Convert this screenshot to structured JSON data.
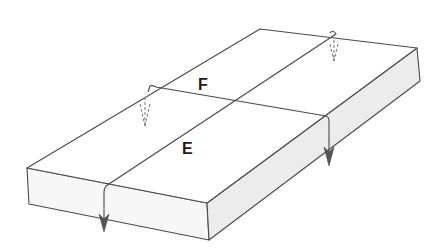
{
  "diagram": {
    "type": "block-diagram",
    "colors": {
      "line": "#4a4a4a",
      "top_face": "#ffffff",
      "front_face": "#f7f7f7",
      "side_face": "#ececec",
      "label": "#1a1a1a"
    },
    "labels": {
      "fault_e": "E",
      "fault_f": "F"
    },
    "faults": [
      {
        "id": "E",
        "trace": "diagonal fault running from back-right to front-left",
        "arrow_dashed_at": "back",
        "arrow_solid_at": "front face"
      },
      {
        "id": "F",
        "trace": "fault running from left-back to right side",
        "arrow_dashed_at": "left",
        "arrow_solid_at": "right side face"
      }
    ]
  }
}
